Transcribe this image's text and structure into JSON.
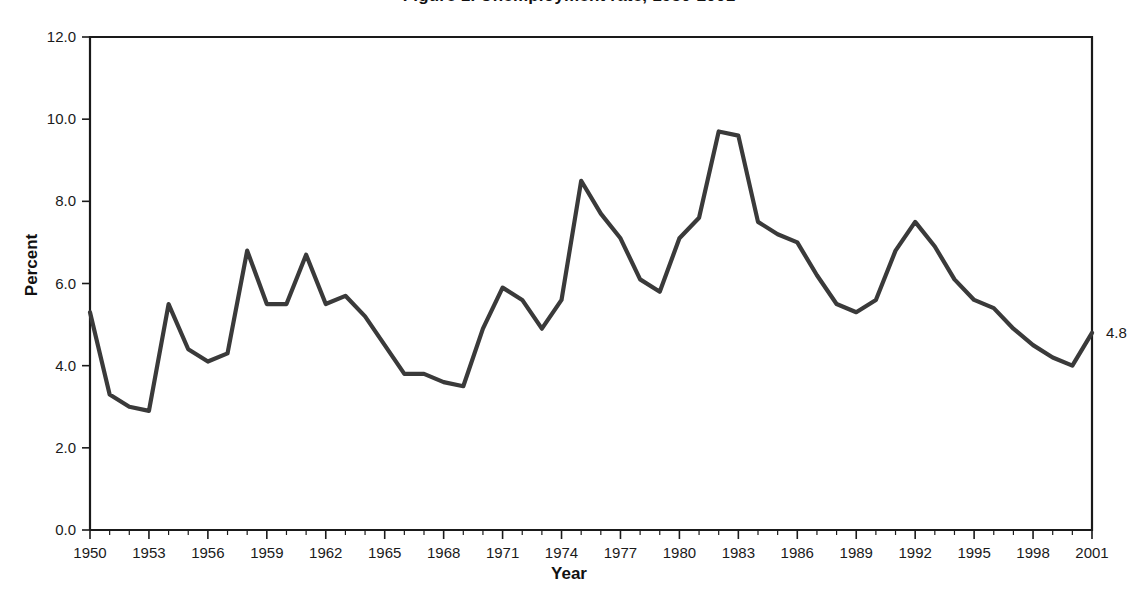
{
  "chart_data": {
    "type": "line",
    "title": "Figure 1. Unemployment rate, 1950-2001",
    "xlabel": "Year",
    "ylabel": "Percent",
    "xlim": [
      1950,
      2001
    ],
    "ylim": [
      0.0,
      12.0
    ],
    "grid": false,
    "legend": null,
    "series_color": "#3a3a3a",
    "annotations": [
      {
        "text": "4.8",
        "x": 2001,
        "y": 4.8,
        "position": "right-of-axis"
      }
    ],
    "y_ticks": [
      "0.0",
      "2.0",
      "4.0",
      "6.0",
      "8.0",
      "10.0",
      "12.0"
    ],
    "y_tick_values": [
      0.0,
      2.0,
      4.0,
      6.0,
      8.0,
      10.0,
      12.0
    ],
    "x_ticks": [
      "1950",
      "1953",
      "1956",
      "1959",
      "1962",
      "1965",
      "1968",
      "1971",
      "1974",
      "1977",
      "1980",
      "1983",
      "1986",
      "1989",
      "1992",
      "1995",
      "1998",
      "2001"
    ],
    "x_tick_values": [
      1950,
      1953,
      1956,
      1959,
      1962,
      1965,
      1968,
      1971,
      1974,
      1977,
      1980,
      1983,
      1986,
      1989,
      1992,
      1995,
      1998,
      2001
    ],
    "x": [
      1950,
      1951,
      1952,
      1953,
      1954,
      1955,
      1956,
      1957,
      1958,
      1959,
      1960,
      1961,
      1962,
      1963,
      1964,
      1965,
      1966,
      1967,
      1968,
      1969,
      1970,
      1971,
      1972,
      1973,
      1974,
      1975,
      1976,
      1977,
      1978,
      1979,
      1980,
      1981,
      1982,
      1983,
      1984,
      1985,
      1986,
      1987,
      1988,
      1989,
      1990,
      1991,
      1992,
      1993,
      1994,
      1995,
      1996,
      1997,
      1998,
      1999,
      2000,
      2001
    ],
    "values": [
      5.3,
      3.3,
      3.0,
      2.9,
      5.5,
      4.4,
      4.1,
      4.3,
      6.8,
      5.5,
      5.5,
      6.7,
      5.5,
      5.7,
      5.2,
      4.5,
      3.8,
      3.8,
      3.6,
      3.5,
      4.9,
      5.9,
      5.6,
      4.9,
      5.6,
      8.5,
      7.7,
      7.1,
      6.1,
      5.8,
      7.1,
      7.6,
      9.7,
      9.6,
      7.5,
      7.2,
      7.0,
      6.2,
      5.5,
      5.3,
      5.6,
      6.8,
      7.5,
      6.9,
      6.1,
      5.6,
      5.4,
      4.9,
      4.5,
      4.2,
      4.0,
      4.8
    ]
  }
}
